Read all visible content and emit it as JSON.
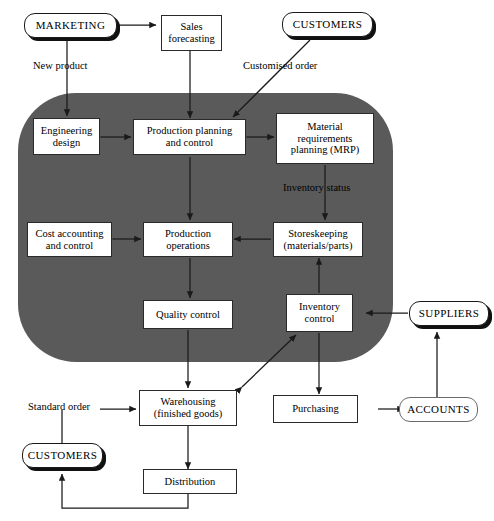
{
  "diagram": {
    "gray_region_color": "#5a5a5a",
    "line_color": "#1a1a1a",
    "box_fill": "#ffffff"
  },
  "nodes": {
    "marketing": {
      "label": "MARKETING",
      "shape": "pill-shadow"
    },
    "sales_forecasting": {
      "label": "Sales\nforecasting",
      "shape": "rect"
    },
    "customers_top": {
      "label": "CUSTOMERS",
      "shape": "pill-shadow"
    },
    "engineering_design": {
      "label": "Engineering\ndesign",
      "shape": "rect"
    },
    "production_planning": {
      "label": "Production planning\nand control",
      "shape": "rect"
    },
    "mrp": {
      "label": "Material\nrequirements\nplanning (MRP)",
      "shape": "rect"
    },
    "cost_accounting": {
      "label": "Cost accounting\nand control",
      "shape": "rect"
    },
    "production_operations": {
      "label": "Production\noperations",
      "shape": "rect"
    },
    "storeskeeping": {
      "label": "Storeskeeping\n(materials/parts)",
      "shape": "rect"
    },
    "quality_control": {
      "label": "Quality control",
      "shape": "rect"
    },
    "inventory_control": {
      "label": "Inventory\ncontrol",
      "shape": "rect"
    },
    "suppliers": {
      "label": "SUPPLIERS",
      "shape": "pill-shadow"
    },
    "warehousing": {
      "label": "Warehousing\n(finished goods)",
      "shape": "rect"
    },
    "purchasing": {
      "label": "Purchasing",
      "shape": "rect"
    },
    "accounts": {
      "label": "ACCOUNTS",
      "shape": "pill-plain"
    },
    "customers_bottom": {
      "label": "CUSTOMERS",
      "shape": "pill-shadow"
    },
    "distribution": {
      "label": "Distribution",
      "shape": "rect"
    }
  },
  "edge_labels": {
    "new_product": "New product",
    "customised_order": "Customised order",
    "inventory_status": "Inventory status",
    "standard_order": "Standard order"
  }
}
